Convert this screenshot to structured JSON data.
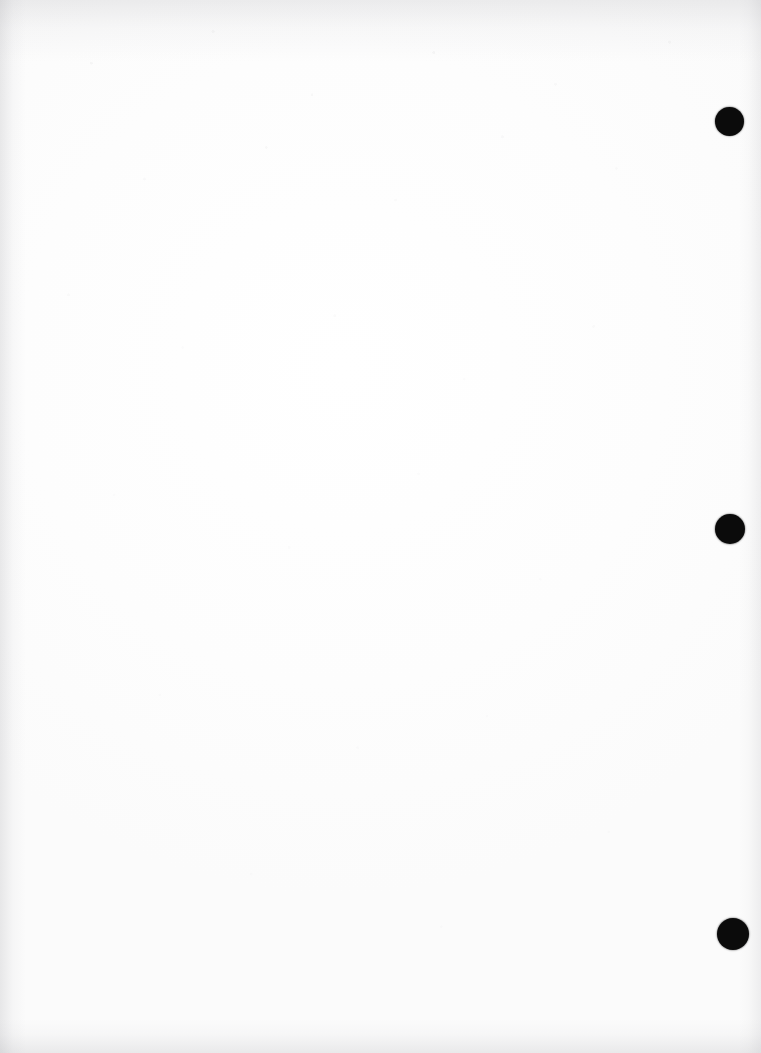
{
  "page": {
    "width": 761,
    "height": 1053,
    "background_color": "#ffffff",
    "paper_tint": "#fdfdfd",
    "text_content": "",
    "body_text": ""
  },
  "marks": {
    "color": "#0b0b0b",
    "shape": "circle",
    "count": 3,
    "items": [
      {
        "name": "hole-mark-top",
        "cx": 729,
        "cy": 121,
        "diameter": 29
      },
      {
        "name": "hole-mark-middle",
        "cx": 730,
        "cy": 529,
        "diameter": 30
      },
      {
        "name": "hole-mark-bottom",
        "cx": 733,
        "cy": 934,
        "diameter": 32
      }
    ]
  },
  "scan_artifacts": {
    "edge_shading_color": "#9a9aa0",
    "noise_color": "#aaaaaf",
    "top_band": true,
    "left_band": true,
    "right_band": true,
    "bottom_band": true
  }
}
